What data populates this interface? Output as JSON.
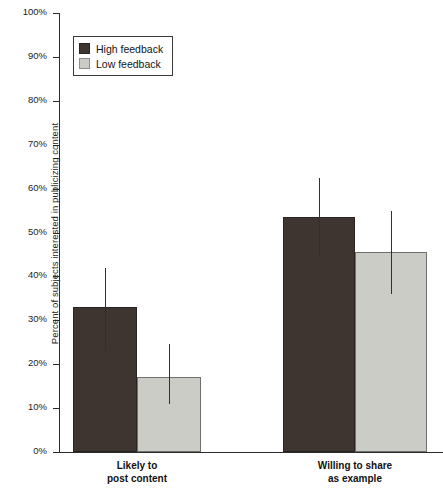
{
  "chart_data": {
    "type": "bar",
    "title": "",
    "xlabel": "",
    "ylabel": "Percent of subjects interested in publicizing content",
    "ylim": [
      0,
      100
    ],
    "yticks": [
      "0%",
      "10%",
      "20%",
      "30%",
      "40%",
      "50%",
      "60%",
      "70%",
      "80%",
      "90%",
      "100%"
    ],
    "ytick_values": [
      0,
      10,
      20,
      30,
      40,
      50,
      60,
      70,
      80,
      90,
      100
    ],
    "grid": false,
    "legend_position": "upper left",
    "categories": [
      "Likely to post content",
      "Willing to share as example"
    ],
    "category_lines": [
      [
        "Likely to",
        "post content"
      ],
      [
        "Willing to share",
        "as example"
      ]
    ],
    "series": [
      {
        "name": "High feedback",
        "color": "#3e3430",
        "values": [
          33,
          53.5
        ],
        "error_low": [
          23,
          44.5
        ],
        "error_high": [
          42,
          62.5
        ]
      },
      {
        "name": "Low feedback",
        "color": "#cbccc6",
        "values": [
          17,
          45.5
        ],
        "error_low": [
          11,
          36
        ],
        "error_high": [
          24.5,
          55
        ]
      }
    ]
  },
  "legend": {
    "items": [
      {
        "label": "High feedback",
        "swatch": "high"
      },
      {
        "label": "Low feedback",
        "swatch": "low"
      }
    ]
  },
  "axis": {
    "y_title": "Percent of subjects interested in publicizing content"
  }
}
